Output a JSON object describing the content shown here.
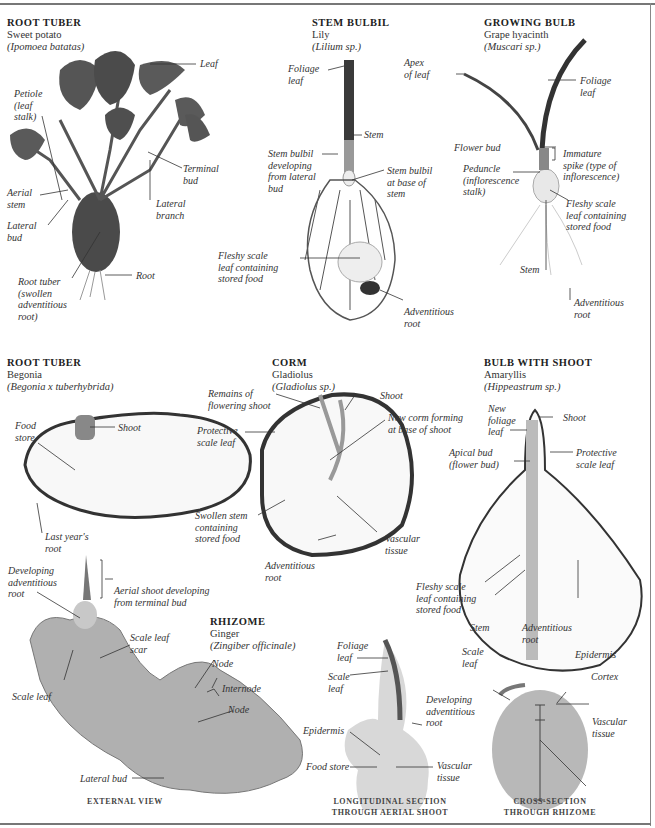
{
  "page": {
    "header_partial_text": "…"
  },
  "specimens": [
    {
      "id": "sweet-potato",
      "type": "ROOT TUBER",
      "common": "Sweet potato",
      "scientific": "(Ipomoea batatas)",
      "labels": [
        "Leaf",
        "Petiole\n(leaf\nstalk)",
        "Terminal\nbud",
        "Aerial\nstem",
        "Lateral\nbranch",
        "Lateral\nbud",
        "Root tuber\n(swollen\nadventitious\nroot)",
        "Root"
      ]
    },
    {
      "id": "lily",
      "type": "STEM BULBIL",
      "common": "Lily",
      "scientific": "(Lilium sp.)",
      "labels": [
        "Foliage\nleaf",
        "Stem",
        "Stem bulbil\ndeveloping\nfrom lateral\nbud",
        "Stem bulbil\nat base of\nstem",
        "Fleshy scale\nleaf containing\nstored food",
        "Adventitious\nroot"
      ]
    },
    {
      "id": "grape-hyacinth",
      "type": "GROWING BULB",
      "common": "Grape hyacinth",
      "scientific": "(Muscari sp.)",
      "labels": [
        "Apex\nof leaf",
        "Foliage\nleaf",
        "Flower bud",
        "Immature\nspike (type of\ninflorescence)",
        "Peduncle\n(inflorescence\nstalk)",
        "Fleshy scale\nleaf containing\nstored food",
        "Stem",
        "Adventitious\nroot"
      ]
    },
    {
      "id": "begonia",
      "type": "ROOT TUBER",
      "common": "Begonia",
      "scientific": "(Begonia x tuberhybrida)",
      "labels": [
        "Food\nstore",
        "Shoot",
        "Last year's\nroot"
      ]
    },
    {
      "id": "gladiolus",
      "type": "CORM",
      "common": "Gladiolus",
      "scientific": "(Gladiolus sp.)",
      "labels": [
        "Remains of\nflowering shoot",
        "Shoot",
        "Protective\nscale leaf",
        "New corm forming\nat base of shoot",
        "Swollen stem\ncontaining\nstored food",
        "Vascular\ntissue",
        "Adventitious\nroot"
      ]
    },
    {
      "id": "amaryllis",
      "type": "BULB WITH SHOOT",
      "common": "Amaryllis",
      "scientific": "(Hippeastrum sp.)",
      "labels": [
        "New\nfoliage\nleaf",
        "Shoot",
        "Apical bud\n(flower bud)",
        "Protective\nscale leaf",
        "Fleshy scale\nleaf containing\nstored food",
        "Stem",
        "Adventitious\nroot"
      ]
    },
    {
      "id": "ginger",
      "type": "RHIZOME",
      "common": "Ginger",
      "scientific": "(Zingiber officinale)",
      "labels": [
        "Developing\nadventitious\nroot",
        "Aerial shoot developing\nfrom terminal bud",
        "Scale leaf\nscar",
        "Scale leaf",
        "Node",
        "Internode",
        "Node",
        "Lateral bud"
      ]
    },
    {
      "id": "ginger-longitudinal",
      "labels": [
        "Foliage\nleaf",
        "Scale\nleaf",
        "Developing\nadventitious\nroot",
        "Epidermis",
        "Food store",
        "Vascular\ntissue"
      ]
    },
    {
      "id": "ginger-cross",
      "labels": [
        "Scale\nleaf",
        "Epidermis",
        "Cortex",
        "Vascular\ntissue"
      ]
    }
  ],
  "captions": {
    "external": "EXTERNAL VIEW",
    "longitudinal": "LONGITUDINAL SECTION\nTHROUGH AERIAL SHOOT",
    "cross": "CROSS-SECTION\nTHROUGH RHIZOME"
  },
  "colors": {
    "frame": "#777777",
    "leader": "#333333",
    "leaf_dark": "#3e3e3e",
    "tuber": "#4a4a4a",
    "flesh": "#f3f3f3",
    "ginger": "#a8a8a8",
    "rhizome_section": "#bdbdbd"
  }
}
